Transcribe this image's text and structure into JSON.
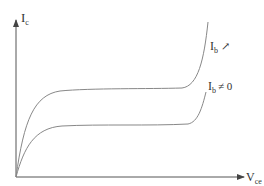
{
  "diagram": {
    "type": "transistor output characteristic",
    "y_axis": {
      "label_main": "I",
      "label_sub": "c"
    },
    "x_axis": {
      "label_main": "V",
      "label_sub": "ce"
    },
    "curves": [
      {
        "name": "upper",
        "label_main": "I",
        "label_sub": "b",
        "label_suffix": "↗"
      },
      {
        "name": "lower",
        "label_main": "I",
        "label_sub": "b",
        "label_suffix": "≠ 0"
      }
    ],
    "colors": {
      "axis": "#555555",
      "curve": "#888888",
      "text": "#333333"
    }
  }
}
